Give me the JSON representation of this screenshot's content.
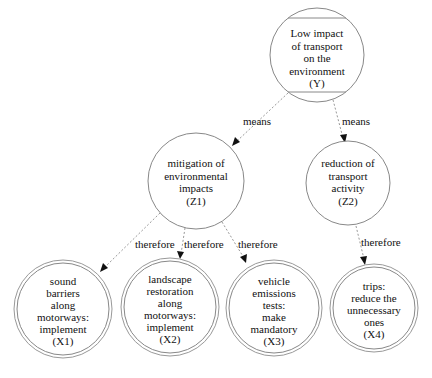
{
  "diagram": {
    "type": "goal-means tree",
    "nodes": [
      {
        "id": "Y",
        "lines": [
          "Low impact",
          "of transport",
          "on the",
          "environment",
          "(Y)"
        ],
        "shape": "mcircle"
      },
      {
        "id": "Z1",
        "lines": [
          "mitigation of",
          "environmental",
          "impacts",
          "(Z1)"
        ],
        "shape": "circle"
      },
      {
        "id": "Z2",
        "lines": [
          "reduction of",
          "transport",
          "activity",
          "(Z2)"
        ],
        "shape": "circle"
      },
      {
        "id": "X1",
        "lines": [
          "sound",
          "barriers",
          "along",
          "motorways:",
          "implement",
          "(X1)"
        ],
        "shape": "doublecircle"
      },
      {
        "id": "X2",
        "lines": [
          "landscape",
          "restoration",
          "along",
          "motorways:",
          "implement",
          "(X2)"
        ],
        "shape": "doublecircle"
      },
      {
        "id": "X3",
        "lines": [
          "vehicle",
          "emissions",
          "tests:",
          "make",
          "mandatory",
          "(X3)"
        ],
        "shape": "doublecircle"
      },
      {
        "id": "X4",
        "lines": [
          "trips:",
          "reduce the",
          "unnecessary",
          "ones",
          "(X4)"
        ],
        "shape": "doublecircle"
      }
    ],
    "edges": [
      {
        "from": "Y",
        "to": "Z1",
        "label": "means"
      },
      {
        "from": "Y",
        "to": "Z2",
        "label": "means"
      },
      {
        "from": "Z1",
        "to": "X1",
        "label": "therefore"
      },
      {
        "from": "Z1",
        "to": "X2",
        "label": "therefore"
      },
      {
        "from": "Z1",
        "to": "X3",
        "label": "therefore"
      },
      {
        "from": "Z2",
        "to": "X4",
        "label": "therefore"
      }
    ],
    "colors": {
      "node_stroke": "#888888",
      "edge_stroke": "#999999",
      "text": "#111111",
      "background": "#ffffff"
    }
  }
}
